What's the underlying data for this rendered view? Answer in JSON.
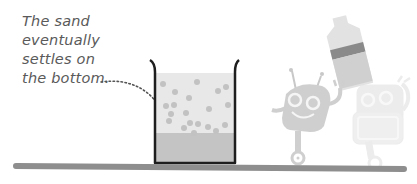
{
  "caption": {
    "lines": [
      "The sand",
      "eventually",
      "settles on",
      "the bottom."
    ]
  },
  "figure": {
    "colors": {
      "text": "#5a5a5a",
      "beaker_outline": "#1e1e1e",
      "water": "#e8e8e8",
      "sand_layer": "#c4c4c4",
      "particles": "#c2c2c2",
      "floor": "#8e8e8e",
      "robot_front": "#cfcfcf",
      "robot_back": "#ececec",
      "bottle_band": "#8a8a8a"
    }
  }
}
